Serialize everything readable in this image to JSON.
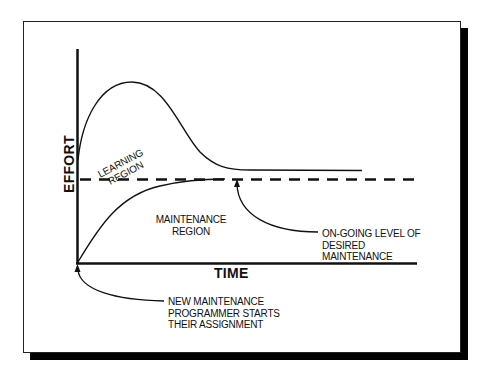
{
  "diagram": {
    "axes": {
      "y_label": "EFFORT",
      "x_label": "TIME"
    },
    "regions": {
      "learning": [
        "LEARNING",
        "REGION"
      ],
      "maintenance": [
        "MAINTENANCE",
        "REGION"
      ]
    },
    "annotations": {
      "desired_level": [
        "ON-GOING LEVEL OF",
        "DESIRED",
        "MAINTENANCE"
      ],
      "start": [
        "NEW MAINTENANCE",
        "PROGRAMMER STARTS",
        "THEIR ASSIGNMENT"
      ]
    },
    "curves": [
      {
        "name": "total-effort-curve",
        "description": "rises sharply, peaks, then declines and levels off above desired level"
      },
      {
        "name": "maintenance-effort-curve",
        "description": "rises from origin and approaches desired level"
      },
      {
        "name": "desired-level-line",
        "style": "dashed"
      }
    ],
    "colors": {
      "line": "#111111",
      "background": "#ffffff",
      "shadow": "#000000"
    }
  }
}
